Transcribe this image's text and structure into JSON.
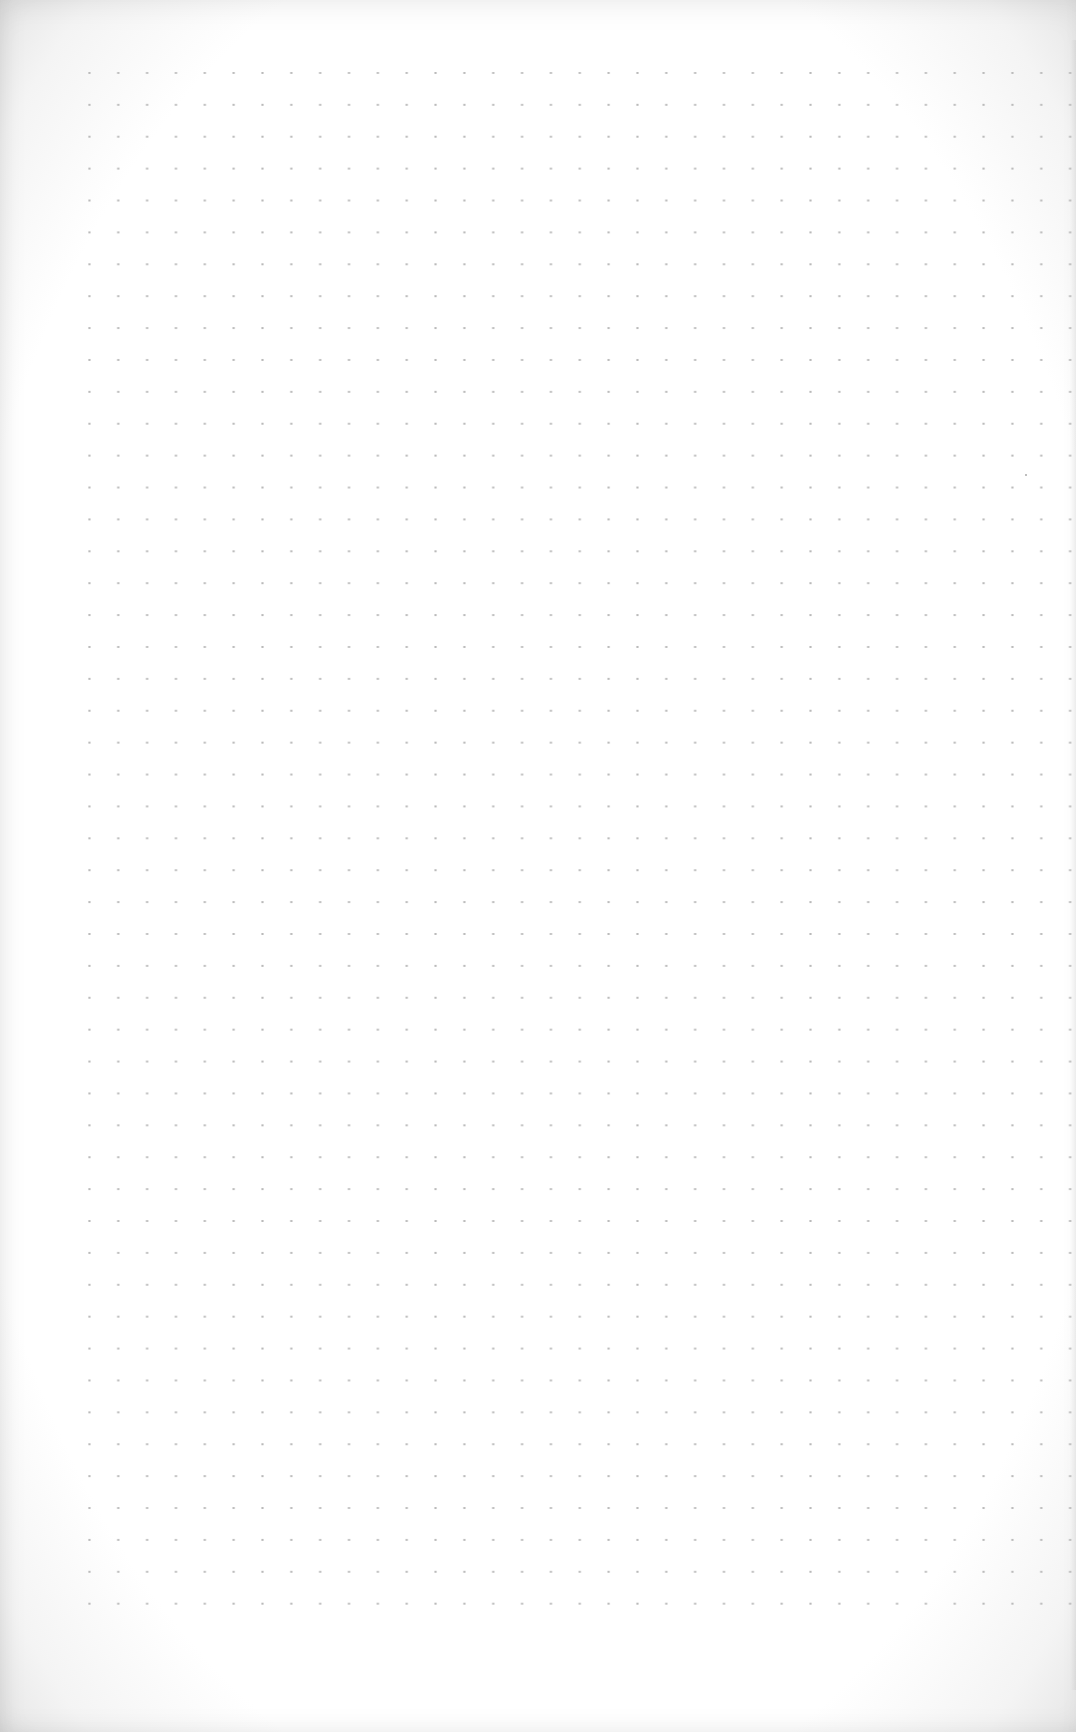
{
  "page": {
    "type": "blank dot-grid paper",
    "content": ""
  },
  "grid": {
    "dot_color": "#b9b9b9",
    "background_color": "#ffffff",
    "columns": 35,
    "rows": 49
  }
}
